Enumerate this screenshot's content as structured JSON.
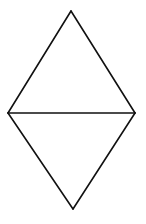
{
  "diagram": {
    "title": "",
    "canvas": {
      "width": 146,
      "height": 224,
      "background": "#ffffff"
    },
    "stroke": {
      "color": "#111111",
      "width": 1.6
    },
    "shape": "rhombus",
    "vertices": {
      "top": [
        71,
        11
      ],
      "left": [
        8,
        113
      ],
      "right": [
        135,
        113
      ],
      "bottom": [
        73,
        209
      ]
    },
    "segments": [
      {
        "name": "top-left-edge",
        "from": "top",
        "to": "left"
      },
      {
        "name": "top-right-edge",
        "from": "top",
        "to": "right"
      },
      {
        "name": "bottom-left-edge",
        "from": "left",
        "to": "bottom"
      },
      {
        "name": "bottom-right-edge",
        "from": "right",
        "to": "bottom"
      },
      {
        "name": "horizontal-diagonal",
        "from": "left",
        "to": "right"
      }
    ]
  }
}
